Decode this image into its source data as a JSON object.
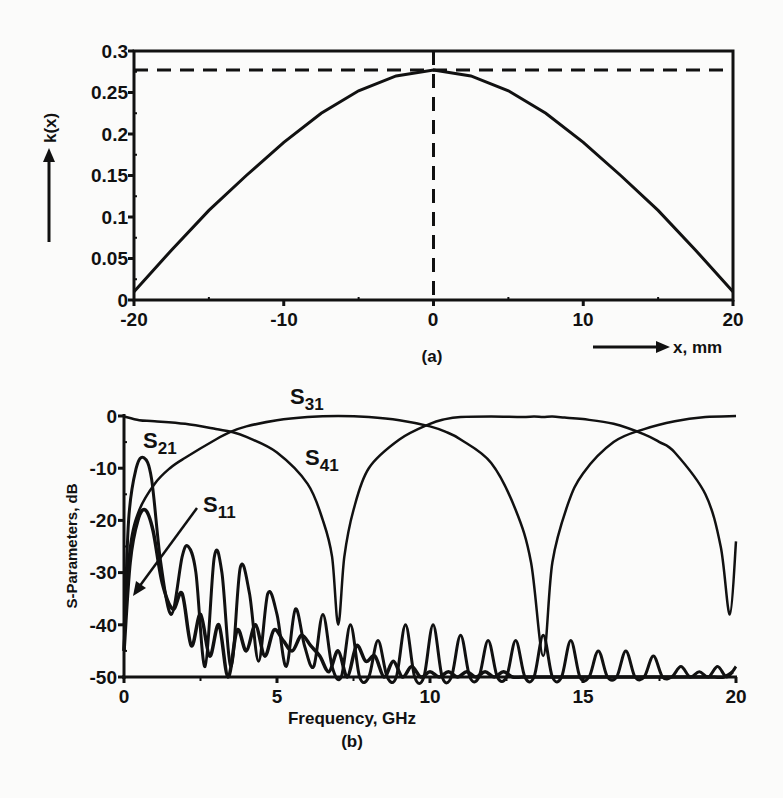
{
  "chart_data": [
    {
      "type": "line",
      "panel_label": "(a)",
      "title": "",
      "xlabel": "x, mm",
      "ylabel": "k(x)",
      "xlim": [
        -20,
        20
      ],
      "ylim": [
        0,
        0.3
      ],
      "xticks": [
        -20,
        -10,
        0,
        10,
        20
      ],
      "yticks": [
        0,
        0.05,
        0.1,
        0.15,
        0.2,
        0.25,
        0.3
      ],
      "ytick_labels": [
        "0",
        "0.05",
        "0.1",
        "0.15",
        "0.2",
        "0.25",
        "0.3"
      ],
      "grid": false,
      "series": [
        {
          "name": "k(x)",
          "style": "solid",
          "x": [
            -20,
            -17.5,
            -15,
            -12.5,
            -10,
            -7.5,
            -5,
            -2.5,
            0,
            2.5,
            5,
            7.5,
            10,
            12.5,
            15,
            17.5,
            20
          ],
          "y": [
            0.01,
            0.06,
            0.108,
            0.15,
            0.19,
            0.225,
            0.252,
            0.27,
            0.277,
            0.27,
            0.252,
            0.225,
            0.19,
            0.15,
            0.108,
            0.06,
            0.01
          ]
        }
      ],
      "reference_lines": [
        {
          "orientation": "horizontal",
          "value": 0.277,
          "style": "dashed"
        },
        {
          "orientation": "vertical",
          "value": 0,
          "style": "dashed"
        }
      ]
    },
    {
      "type": "line",
      "panel_label": "(b)",
      "title": "",
      "xlabel": "Frequency, GHz",
      "ylabel": "S-Parameters, dB",
      "xlim": [
        0,
        20
      ],
      "ylim": [
        -50,
        0
      ],
      "xticks": [
        0,
        5,
        10,
        15,
        20
      ],
      "yticks": [
        0,
        -10,
        -20,
        -30,
        -40,
        -50
      ],
      "grid": false,
      "series": [
        {
          "name": "S31",
          "label_main": "S",
          "label_sub": "31",
          "x": [
            0,
            0.5,
            1,
            2,
            3,
            3.5,
            4,
            5,
            6,
            6.5,
            6.8,
            7.0,
            7.2,
            7.5,
            8,
            9,
            10,
            10.5,
            11,
            12,
            13,
            13.4,
            13.7,
            14,
            14.4,
            15,
            16,
            17,
            17.5,
            18,
            19,
            19.5,
            19.8,
            20
          ],
          "y": [
            -0.1,
            -0.8,
            -1,
            -1.5,
            -2.5,
            -3,
            -4,
            -7,
            -13,
            -20,
            -27,
            -40,
            -27,
            -18,
            -10,
            -4.5,
            -1.5,
            -0.6,
            -0.2,
            -0.1,
            -0.2,
            -0.1,
            -0.2,
            -0.1,
            -0.3,
            -0.6,
            -1.5,
            -3.5,
            -5,
            -7,
            -15,
            -25,
            -38,
            -24
          ]
        },
        {
          "name": "S41",
          "label_main": "S",
          "label_sub": "41",
          "x": [
            0,
            0.2,
            0.5,
            1,
            1.5,
            2,
            3,
            3.5,
            4,
            5,
            6,
            7,
            8,
            9,
            10,
            10.5,
            11,
            12,
            12.8,
            13.3,
            13.7,
            14,
            14.5,
            15,
            16,
            17,
            18,
            19,
            20
          ],
          "y": [
            -40,
            -25,
            -18,
            -13,
            -10,
            -8,
            -4.5,
            -3,
            -2,
            -0.8,
            -0.2,
            0,
            -0.2,
            -0.8,
            -2,
            -3,
            -4.5,
            -9,
            -18,
            -28,
            -46,
            -28,
            -17,
            -11,
            -5,
            -2.5,
            -1,
            -0.2,
            0
          ]
        },
        {
          "name": "S21",
          "label_main": "S",
          "label_sub": "21",
          "x": [
            0,
            0.15,
            0.4,
            0.65,
            0.9,
            1.2,
            1.55,
            1.9,
            2.1,
            2.35,
            2.65,
            2.95,
            3.2,
            3.5,
            3.8,
            4.1,
            4.4,
            4.7,
            5.0,
            5.3,
            5.6,
            5.9,
            6.2,
            6.5,
            6.8,
            7.1,
            7.4,
            7.7,
            8.0,
            8.3,
            8.6,
            8.9,
            9.2,
            9.5,
            9.8,
            10.1,
            10.4,
            10.7,
            11.0,
            11.3,
            11.6,
            11.9,
            12.2,
            12.5,
            12.8,
            13.1,
            13.4,
            13.7,
            14.0,
            14.3,
            14.6,
            14.9,
            15.2,
            15.5,
            15.8,
            16.1,
            16.4,
            16.7,
            17.0,
            17.3,
            17.6,
            17.9,
            18.2,
            18.5,
            18.8,
            19.1,
            19.4,
            19.7,
            20.0
          ],
          "y": [
            -45,
            -20,
            -10,
            -8,
            -12,
            -28,
            -38,
            -27,
            -25,
            -30,
            -48,
            -27,
            -30,
            -48,
            -29,
            -34,
            -47,
            -34,
            -38,
            -48,
            -37,
            -44,
            -48,
            -38,
            -48,
            -50,
            -40,
            -50,
            -50,
            -43,
            -50,
            -50,
            -40,
            -50,
            -50,
            -40,
            -50,
            -50,
            -42,
            -50,
            -50,
            -43,
            -50,
            -50,
            -43,
            -50,
            -50,
            -42,
            -50,
            -50,
            -43,
            -50,
            -50,
            -45,
            -50,
            -50,
            -45,
            -50,
            -50,
            -46,
            -50,
            -50,
            -48,
            -50,
            -49,
            -50,
            -48,
            -50,
            -48
          ]
        },
        {
          "name": "S11",
          "label_main": "S",
          "label_sub": "11",
          "x": [
            0,
            0.2,
            0.45,
            0.7,
            0.95,
            1.25,
            1.6,
            1.9,
            2.2,
            2.5,
            2.8,
            3.1,
            3.4,
            3.7,
            4.0,
            4.3,
            4.6,
            4.9,
            5.2,
            5.5,
            5.8,
            6.1,
            6.4,
            6.7,
            7.0,
            7.3,
            7.6,
            7.9,
            8.2,
            8.5,
            8.8,
            9.1,
            9.4,
            9.7,
            10.0,
            10.3,
            10.6,
            10.9,
            11.2,
            11.5,
            11.8,
            12.1,
            12.4,
            12.7,
            13.0,
            13.3,
            13.6,
            13.9,
            14.2,
            14.5,
            14.8,
            15.1,
            15.4,
            15.7,
            16.0,
            16.3,
            16.6,
            16.9,
            17.2,
            17.5,
            17.8,
            18.1,
            18.4,
            18.7,
            19.0,
            19.3,
            19.6,
            19.9
          ],
          "y": [
            -45,
            -28,
            -20,
            -18,
            -22,
            -32,
            -37,
            -34,
            -44,
            -38,
            -46,
            -40,
            -50,
            -41,
            -45,
            -40,
            -46,
            -41,
            -43,
            -45,
            -42,
            -44,
            -46,
            -49,
            -45,
            -50,
            -44,
            -47,
            -46,
            -50,
            -47,
            -50,
            -48,
            -50,
            -49,
            -50,
            -49,
            -50,
            -49,
            -50,
            -49,
            -50,
            -49,
            -50,
            -50,
            -50,
            -50,
            -50,
            -50,
            -50,
            -50,
            -50,
            -50,
            -50,
            -50,
            -50,
            -50,
            -50,
            -50,
            -50,
            -50,
            -50,
            -50,
            -50,
            -50,
            -50,
            -50,
            -49
          ]
        }
      ]
    }
  ],
  "panel_a": {
    "label": "(a)",
    "xlabel": "x, mm",
    "ylabel": "k(x)",
    "xticks": [
      "-20",
      "-10",
      "0",
      "10",
      "20"
    ],
    "yticks": [
      "0",
      "0.05",
      "0.1",
      "0.15",
      "0.2",
      "0.25",
      "0.3"
    ]
  },
  "panel_b": {
    "label": "(b)",
    "xlabel": "Frequency, GHz",
    "ylabel": "S-Parameters, dB",
    "xticks": [
      "0",
      "5",
      "10",
      "15",
      "20"
    ],
    "yticks": [
      "0",
      "-10",
      "-20",
      "-30",
      "-40",
      "-50"
    ],
    "curve_labels": {
      "s31": {
        "main": "S",
        "sub": "31"
      },
      "s41": {
        "main": "S",
        "sub": "41"
      },
      "s21": {
        "main": "S",
        "sub": "21"
      },
      "s11": {
        "main": "S",
        "sub": "11"
      }
    }
  }
}
